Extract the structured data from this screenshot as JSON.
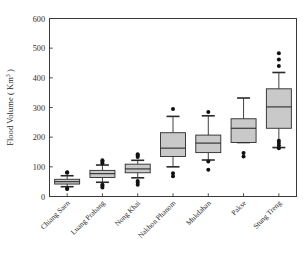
{
  "chart_data": {
    "type": "box",
    "title": "",
    "xlabel": "",
    "ylabel": "Flood Volume ( Km",
    "ylabel_sup": "3",
    "ylabel_tail": " )",
    "ylim": [
      0,
      600
    ],
    "yticks": [
      0,
      100,
      200,
      300,
      400,
      500,
      600
    ],
    "ytick_labels": [
      "0",
      "100",
      "200",
      "300",
      "400",
      "500",
      "600"
    ],
    "grid": false,
    "legend": "none",
    "categories": [
      "Chiang Saen",
      "Luang Prabang",
      "Nong Khai",
      "Nakhon Phanom",
      "Mukdahan",
      "Pakse",
      "Stung Treng"
    ],
    "boxes": [
      {
        "name": "Chiang Saen",
        "whisker_low": 33,
        "q1": 42,
        "median": 50,
        "q3": 58,
        "whisker_high": 70,
        "outliers": [
          25,
          27,
          80,
          82
        ]
      },
      {
        "name": "Luang Prabang",
        "whisker_low": 48,
        "q1": 64,
        "median": 77,
        "q3": 88,
        "whisker_high": 106,
        "outliers": [
          30,
          36,
          40,
          112,
          118,
          122
        ]
      },
      {
        "name": "Nong Khai",
        "whisker_low": 63,
        "q1": 80,
        "median": 93,
        "q3": 109,
        "whisker_high": 122,
        "outliers": [
          40,
          46,
          52,
          133,
          138,
          142
        ]
      },
      {
        "name": "Nakhon Phanom",
        "whisker_low": 100,
        "q1": 135,
        "median": 163,
        "q3": 215,
        "whisker_high": 270,
        "outliers": [
          68,
          78,
          295
        ]
      },
      {
        "name": "Mukdahan",
        "whisker_low": 123,
        "q1": 148,
        "median": 180,
        "q3": 207,
        "whisker_high": 272,
        "outliers": [
          90,
          118,
          285
        ]
      },
      {
        "name": "Pakse",
        "whisker_low": 182,
        "q1": 182,
        "median": 230,
        "q3": 262,
        "whisker_high": 332,
        "outliers": [
          135,
          147
        ]
      },
      {
        "name": "Stung Treng",
        "whisker_low": 165,
        "q1": 230,
        "median": 302,
        "q3": 363,
        "whisker_high": 418,
        "outliers": [
          163,
          172,
          180,
          188,
          440,
          462,
          483
        ]
      }
    ],
    "colors": {
      "box_fill": "#c9c9c9",
      "box_stroke": "#2a2a2a",
      "outlier": "#111111",
      "axis": "#3a3a3a",
      "background": "#ffffff"
    }
  }
}
